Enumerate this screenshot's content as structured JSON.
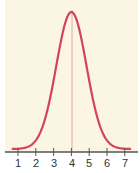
{
  "chart_data": {
    "type": "line",
    "title": "",
    "xlabel": "",
    "ylabel": "",
    "x_ticks": [
      "1",
      "2",
      "3",
      "4",
      "5",
      "6",
      "7"
    ],
    "xlim": [
      0.7,
      7.3
    ],
    "ylim": [
      0,
      1
    ],
    "grid": false,
    "legend": null,
    "series": [
      {
        "name": "normal distribution curve",
        "mean": 4,
        "sd": 0.85,
        "x": [
          0.7,
          1,
          1.5,
          2,
          2.5,
          3,
          3.5,
          4,
          4.5,
          5,
          5.5,
          6,
          6.5,
          7,
          7.3
        ],
        "y": [
          0.0,
          0.002,
          0.02,
          0.06,
          0.2,
          0.5,
          0.84,
          1.0,
          0.84,
          0.5,
          0.2,
          0.06,
          0.02,
          0.002,
          0.0
        ]
      }
    ],
    "annotations": [
      {
        "type": "vertical-line",
        "x": 4,
        "label": "mean"
      }
    ]
  },
  "colors": {
    "background": "#fbf6e4",
    "curve": "#d3435f",
    "mean_line": "#e8a4ae",
    "axis": "#555555"
  },
  "labels": {
    "t1": "1",
    "t2": "2",
    "t3": "3",
    "t4": "4",
    "t5": "5",
    "t6": "6",
    "t7": "7"
  }
}
